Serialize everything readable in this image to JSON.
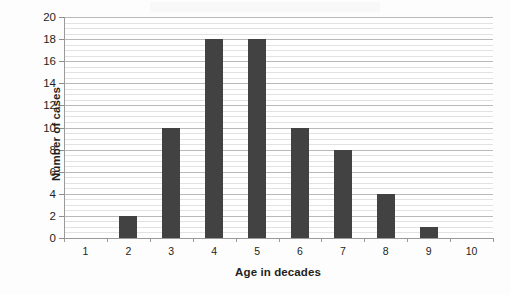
{
  "chart_data": {
    "type": "bar",
    "title": "",
    "subtitle": "",
    "xlabel": "Age in decades",
    "ylabel": "Number of cases",
    "categories": [
      "1",
      "2",
      "3",
      "4",
      "5",
      "6",
      "7",
      "8",
      "9",
      "10"
    ],
    "values": [
      0,
      2,
      10,
      18,
      18,
      10,
      8,
      4,
      1,
      0
    ],
    "series": [
      {
        "name": "Number of cases",
        "values": [
          0,
          2,
          10,
          18,
          18,
          10,
          8,
          4,
          1,
          0
        ]
      }
    ],
    "xlim": [
      0.5,
      10.5
    ],
    "ylim": [
      0,
      20
    ],
    "ytick_labels": [
      "0",
      "2",
      "4",
      "6",
      "8",
      "10",
      "12",
      "14",
      "16",
      "18",
      "20"
    ],
    "ytick_values": [
      0,
      2,
      4,
      6,
      8,
      10,
      12,
      14,
      16,
      18,
      20
    ],
    "ytick_step": 2,
    "xtick_labels": [
      "1",
      "2",
      "3",
      "4",
      "5",
      "6",
      "7",
      "8",
      "9",
      "10"
    ],
    "grid": true,
    "grid_orientation": "horizontal",
    "minor_grid": true,
    "minor_grid_step": 0.5,
    "legend": false,
    "legend_position": "none",
    "annotations": [],
    "bar_color": "#424242",
    "major_gridline_color": "#b9b9b9",
    "minor_gridline_color": "#e2e2e2",
    "axis_line_color": "#9a9a9a",
    "text_color": "#231f20",
    "plot_background": "#ffffff",
    "figure_background": "#fdfdfd"
  },
  "axis_titles": {
    "y": "Number of cases",
    "x": "Age in decades"
  }
}
